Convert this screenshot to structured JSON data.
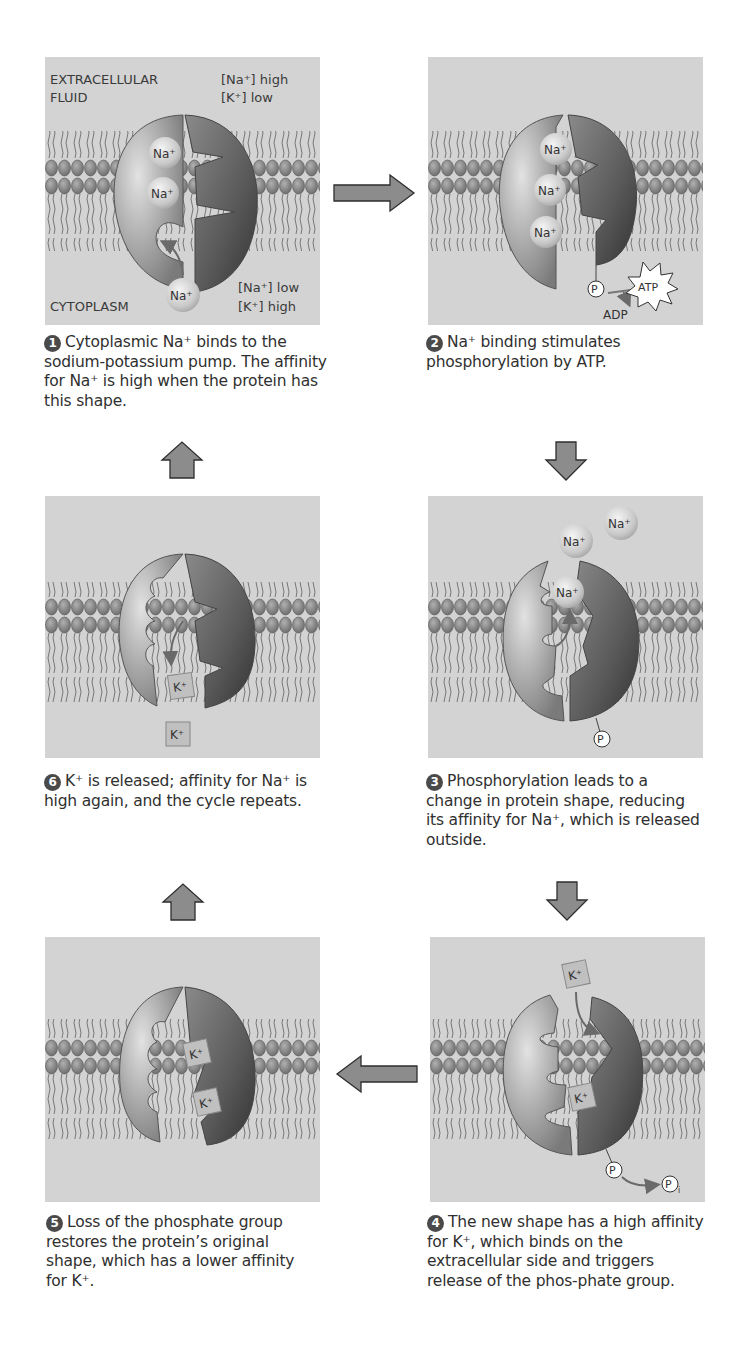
{
  "colors": {
    "panel_background": "#d3d3d3",
    "protein_light": "#b5b5b5",
    "protein_dark": "#4a4a4a",
    "lipid_head": "#8a8a8a",
    "arrow_fill": "#8c8c8c",
    "arrow_stroke": "#2e2e2e",
    "text": "#303030"
  },
  "panel1": {
    "region_top": "EXTRACELLULAR",
    "region_top_2": "FLUID",
    "region_bottom": "CYTOPLASM",
    "conc_out_na": "[Na⁺] high",
    "conc_out_k": "[K⁺] low",
    "conc_in_na": "[Na⁺] low",
    "conc_in_k": "[K⁺] high",
    "ion": "Na⁺"
  },
  "panel2": {
    "ion": "Na⁺",
    "phosphate": "P",
    "atp": "ATP",
    "adp": "ADP"
  },
  "panel3": {
    "ion": "Na⁺",
    "phosphate": "P"
  },
  "panel4": {
    "ion": "K⁺",
    "phosphate": "P",
    "pi": "P",
    "pi_sub": "i"
  },
  "panel5": {
    "ion": "K⁺"
  },
  "panel6": {
    "ion": "K⁺"
  },
  "steps": [
    {
      "number": "1",
      "text": "Cytoplasmic Na⁺ binds to the sodium-potassium pump. The affinity for Na⁺ is high when the protein has this shape."
    },
    {
      "number": "2",
      "text": "Na⁺ binding stimulates phosphorylation by ATP."
    },
    {
      "number": "3",
      "text": "Phosphorylation leads to a change in protein shape, reducing its affinity for Na⁺, which is released outside."
    },
    {
      "number": "4",
      "text": "The new shape has a high affinity for K⁺, which binds on the extracellular side and triggers release of the phos-phate group."
    },
    {
      "number": "5",
      "text": "Loss of the phosphate group restores the protein’s original shape, which has a lower affinity for K⁺."
    },
    {
      "number": "6",
      "text": "K⁺ is released; affinity for Na⁺ is high again, and the cycle repeats."
    }
  ],
  "arrows": [
    {
      "from": "1",
      "to": "2",
      "direction": "right"
    },
    {
      "from": "2",
      "to": "3",
      "direction": "down"
    },
    {
      "from": "3",
      "to": "4",
      "direction": "down"
    },
    {
      "from": "4",
      "to": "5",
      "direction": "left"
    },
    {
      "from": "5",
      "to": "6",
      "direction": "up"
    },
    {
      "from": "6",
      "to": "1",
      "direction": "up"
    }
  ]
}
